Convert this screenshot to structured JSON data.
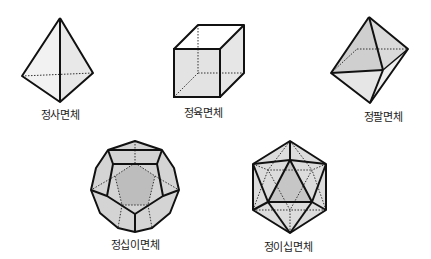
{
  "solids": [
    {
      "id": "tetrahedron",
      "label": "정사면체",
      "faces": 4
    },
    {
      "id": "cube",
      "label": "정육면체",
      "faces": 6
    },
    {
      "id": "octahedron",
      "label": "정팔면체",
      "faces": 8
    },
    {
      "id": "dodecahedron",
      "label": "정십이면체",
      "faces": 12
    },
    {
      "id": "icosahedron",
      "label": "정이십면체",
      "faces": 20
    }
  ],
  "colors": {
    "stroke": "#111111",
    "face_light": "#f0f0f0",
    "face_mid": "#dcdcdc",
    "face_dark": "#c4c4c4",
    "hidden_edge": "#333333"
  }
}
